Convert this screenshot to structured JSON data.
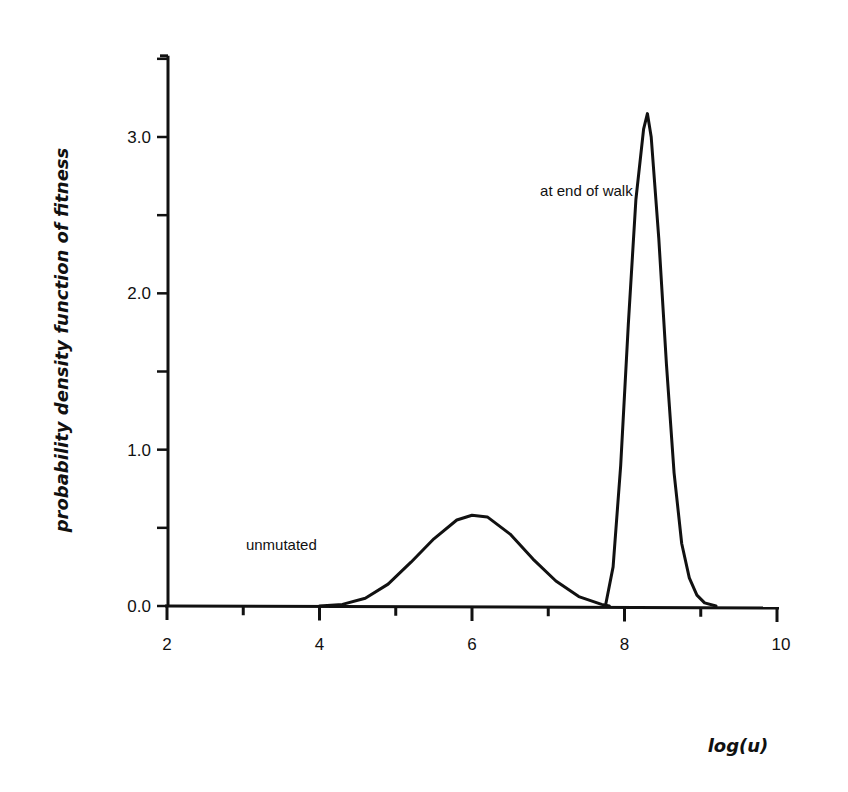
{
  "chart_data": {
    "type": "line",
    "title": "",
    "xlabel": "log(u)",
    "ylabel": "probability density function of fitness",
    "xlim": [
      2,
      10
    ],
    "ylim": [
      0,
      3.5
    ],
    "x_ticks": [
      "2",
      "4",
      "6",
      "8",
      "10"
    ],
    "y_ticks": [
      "0.0",
      "1.0",
      "2.0",
      "3.0"
    ],
    "grid": false,
    "legend": null,
    "series": [
      {
        "name": "unmutated",
        "x": [
          4.0,
          4.3,
          4.6,
          4.9,
          5.2,
          5.5,
          5.8,
          6.0,
          6.2,
          6.5,
          6.8,
          7.1,
          7.4,
          7.7,
          7.8
        ],
        "y": [
          0.0,
          0.01,
          0.05,
          0.14,
          0.28,
          0.43,
          0.55,
          0.58,
          0.57,
          0.46,
          0.3,
          0.16,
          0.06,
          0.01,
          0.0
        ]
      },
      {
        "name": "at end of walk",
        "x": [
          7.75,
          7.85,
          7.95,
          8.05,
          8.15,
          8.25,
          8.3,
          8.35,
          8.45,
          8.55,
          8.65,
          8.75,
          8.85,
          8.95,
          9.05,
          9.2
        ],
        "y": [
          0.0,
          0.25,
          0.9,
          1.8,
          2.6,
          3.05,
          3.15,
          3.0,
          2.35,
          1.55,
          0.85,
          0.4,
          0.18,
          0.07,
          0.02,
          0.0
        ]
      }
    ],
    "annotations": [
      {
        "text": "unmutated",
        "x": 3.5,
        "y": 0.36
      },
      {
        "text": "at end of walk",
        "x": 7.5,
        "y": 2.62
      }
    ]
  }
}
